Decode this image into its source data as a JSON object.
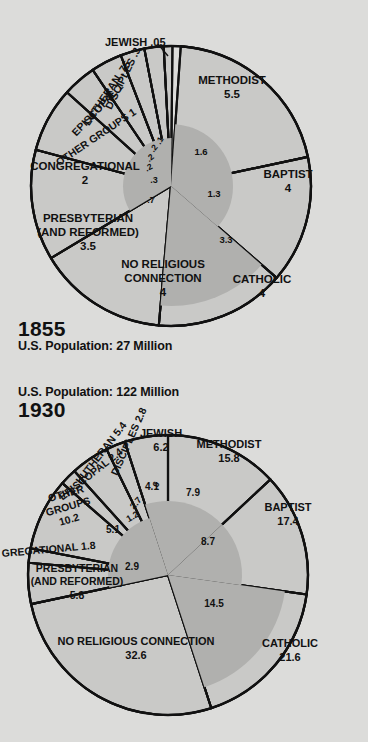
{
  "page": {
    "background_color": "#dcdcda",
    "ink_color": "#111111",
    "slice_fill": "#c9c9c7",
    "inner_fill": "#b0b0ae"
  },
  "panels": [
    {
      "id": "chart-1855",
      "year": "1855",
      "population_label": "U.S. Population: 27 Million",
      "title_order": [
        "year",
        "population"
      ]
    },
    {
      "id": "chart-1930",
      "year": "1930",
      "population_label": "U.S. Population: 122 Million",
      "title_order": [
        "population",
        "year"
      ]
    }
  ],
  "chart_data": [
    {
      "type": "pie",
      "title": "1855",
      "subtitle": "U.S. Population: 27 Million",
      "units": "millions of people",
      "total": 27,
      "categories": [
        "METHODIST",
        "BAPTIST",
        "CATHOLIC",
        "NO RELIGIOUS CONNECTION",
        "PRESBYTERIAN (AND REFORMED)",
        "CONGREGATIONAL",
        "OTHER GROUPS",
        "EPISCOPAL",
        "LUTHERAN",
        "DISCIPLES",
        "JEWISH"
      ],
      "values": [
        5.5,
        4,
        4,
        4,
        3.5,
        2,
        1,
        1,
        0.75,
        0.3,
        0.05
      ],
      "labels": [
        {
          "name": "METHODIST",
          "value": "5.5"
        },
        {
          "name": "BAPTIST",
          "value": "4"
        },
        {
          "name": "CATHOLIC",
          "value": "4"
        },
        {
          "name": "NO RELIGIOUS CONNECTION",
          "value": "4"
        },
        {
          "name": "PRESBYTERIAN (AND REFORMED)",
          "value": "3.5"
        },
        {
          "name": "CONGREGATIONAL",
          "value": "2"
        },
        {
          "name": "OTHER GROUPS",
          "value": "1"
        },
        {
          "name": "EPISCOPAL",
          "value": "1"
        },
        {
          "name": "LUTHERAN",
          "value": ".75"
        },
        {
          "name": "DISCIPLES",
          "value": ".3"
        },
        {
          "name": "JEWISH",
          "value": ".05"
        }
      ],
      "inner_ring_note": "shaded inner sector values",
      "inner_values": [
        "1.6",
        "1.3",
        "3.3",
        ".7",
        ".3",
        ".2",
        ".2",
        ".2",
        ".1"
      ]
    },
    {
      "type": "pie",
      "title": "1930",
      "subtitle": "U.S. Population: 122 Million",
      "units": "millions of people",
      "total": 122,
      "categories": [
        "NO RELIGIOUS CONNECTION",
        "CATHOLIC",
        "BAPTIST",
        "METHODIST",
        "OTHER GROUPS",
        "JEWISH",
        "PRESBYTERIAN (AND REFORMED)",
        "LUTHERAN",
        "DISCIPLES",
        "EPISCOPAL",
        "CONGREGATIONAL"
      ],
      "values": [
        32.6,
        21.6,
        17.4,
        15.8,
        10.2,
        6.2,
        5.8,
        5.4,
        2.8,
        2.4,
        1.8
      ],
      "labels": [
        {
          "name": "NO RELIGIOUS CONNECTION",
          "value": "32.6"
        },
        {
          "name": "CATHOLIC",
          "value": "21.6"
        },
        {
          "name": "BAPTIST",
          "value": "17.4"
        },
        {
          "name": "METHODIST",
          "value": "15.8"
        },
        {
          "name": "OTHER GROUPS",
          "value": "10.2"
        },
        {
          "name": "JEWISH",
          "value": "6.2"
        },
        {
          "name": "PRESBYTERIAN (AND REFORMED)",
          "value": "5.8"
        },
        {
          "name": "LUTHERAN",
          "value": "5.4"
        },
        {
          "name": "DISCIPLES",
          "value": "2.8"
        },
        {
          "name": "EPISCOPAL",
          "value": "2.4"
        },
        {
          "name": "GREGATIONAL",
          "value": "1.8"
        }
      ],
      "inner_values": [
        "7.9",
        "8.7",
        "14.5",
        "4.1",
        "5.1",
        "2.9",
        "2.7",
        "1.2",
        ".6"
      ]
    }
  ],
  "chart1855": {
    "methodist_name": "METHODIST",
    "methodist_value": "5.5",
    "baptist_name": "BAPTIST",
    "baptist_value": "4",
    "catholic_name": "CATHOLIC",
    "catholic_value": "4",
    "norel_name1": "NO RELIGIOUS",
    "norel_name2": "CONNECTION",
    "norel_value": "4",
    "presby_name1": "PRESBYTERIAN",
    "presby_name2": "(AND REFORMED)",
    "presby_value": "3.5",
    "congr_name": "CONGREGATIONAL",
    "congr_value": "2",
    "other_name": "OTHER GROUPS",
    "other_value": "1",
    "episc_name": "EPISCOPAL",
    "episc_value": "1",
    "luth_name": "LUTHERAN",
    "luth_value": ".75",
    "disc_name": "DISCIPLES",
    "disc_value": ".3",
    "jewish_name": "JEWISH .05",
    "inner_methodist": "1.6",
    "inner_baptist": "1.3",
    "inner_catholic": "3.3",
    "inner_presby": ".7",
    "inner_congr": ".3",
    "inner_other": ".2",
    "inner_episc": ".2",
    "inner_luth": ".2",
    "inner_disc": ".1"
  },
  "chart1930": {
    "methodist_name": "METHODIST",
    "methodist_value": "15.8",
    "baptist_name": "BAPTIST",
    "baptist_value": "17.4",
    "catholic_name": "CATHOLIC",
    "catholic_value": "21.6",
    "norel_name": "NO RELIGIOUS CONNECTION",
    "norel_value": "32.6",
    "presby_name1": "PRESBYTERIAN",
    "presby_name2": "(AND REFORMED)",
    "presby_value": "5.8",
    "congr_label": "GREGATIONAL 1.8",
    "other_name1": "OTHER",
    "other_name2": "GROUPS",
    "other_value": "10.2",
    "episc_label": "EPISCOPAL 2.4",
    "luth_name": "LUTHERAN",
    "luth_value": "5.4",
    "disc_label": "DISCIPLES 2.8",
    "jewish_name": "JEWISH",
    "jewish_value": "6.2",
    "inner_methodist": "7.9",
    "inner_baptist": "8.7",
    "inner_catholic": "14.5",
    "inner_jewish": "4.1",
    "inner_other": "5.1",
    "inner_presby": "2.9",
    "inner_luth": "2.7",
    "inner_episc": "1.2",
    "inner_disc": ".6"
  }
}
